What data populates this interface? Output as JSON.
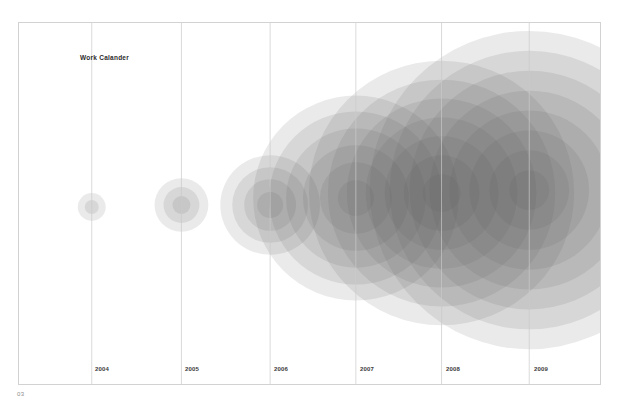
{
  "page": {
    "number_label": "03",
    "background_color": "#ffffff",
    "frame_border_color": "#d2d2d2"
  },
  "chart_title": "Work Calander",
  "axis": {
    "gridline_color": "#c9c9c9",
    "label_color": "#3a3a3a"
  },
  "chart_data": {
    "type": "scatter",
    "title": "Work Calander",
    "xlabel": "",
    "ylabel": "",
    "grid": true,
    "legend_position": "none",
    "x_categories": [
      "2004",
      "2005",
      "2006",
      "2007",
      "2008",
      "2009"
    ],
    "x_tick_px": [
      91,
      181,
      270,
      356,
      442,
      530
    ],
    "baseline_y_px": 205,
    "note": "Concentric translucent grey bubble clusters, one cluster per year, centred on each year gridline. Ring count and outer radius grow year over year; overlapping alpha creates the dark core.",
    "series": [
      {
        "name": "2004",
        "x": "2004",
        "center_px": [
          91,
          207
        ],
        "ring_count": 2,
        "outer_radius_px": 14,
        "ring_radii_px": [
          14,
          7
        ],
        "value": 1
      },
      {
        "name": "2005",
        "x": "2005",
        "center_px": [
          181,
          205
        ],
        "ring_count": 3,
        "outer_radius_px": 27,
        "ring_radii_px": [
          27,
          18,
          9
        ],
        "value": 2
      },
      {
        "name": "2006",
        "x": "2006",
        "center_px": [
          270,
          205
        ],
        "ring_count": 4,
        "outer_radius_px": 50,
        "ring_radii_px": [
          50,
          38,
          26,
          13
        ],
        "value": 4
      },
      {
        "name": "2007",
        "x": "2007",
        "center_px": [
          356,
          198
        ],
        "ring_count": 6,
        "outer_radius_px": 103,
        "ring_radii_px": [
          103,
          87,
          70,
          53,
          36,
          18
        ],
        "value": 8
      },
      {
        "name": "2008",
        "x": "2008",
        "center_px": [
          442,
          193
        ],
        "ring_count": 7,
        "outer_radius_px": 133,
        "ring_radii_px": [
          133,
          114,
          95,
          76,
          57,
          38,
          19
        ],
        "value": 12
      },
      {
        "name": "2009",
        "x": "2009",
        "center_px": [
          530,
          190
        ],
        "ring_count": 8,
        "outer_radius_px": 160,
        "ring_radii_px": [
          160,
          140,
          120,
          100,
          80,
          60,
          40,
          20
        ],
        "value": 16
      }
    ],
    "bubble_fill_color": "#5a5a5a",
    "bubble_ring_alpha": 0.13,
    "darkest_core_color": "#2a2a2a"
  },
  "year_labels": [
    {
      "text": "2004",
      "x_px": 95
    },
    {
      "text": "2005",
      "x_px": 185
    },
    {
      "text": "2006",
      "x_px": 274
    },
    {
      "text": "2007",
      "x_px": 360
    },
    {
      "text": "2008",
      "x_px": 446
    },
    {
      "text": "2009",
      "x_px": 534
    }
  ]
}
